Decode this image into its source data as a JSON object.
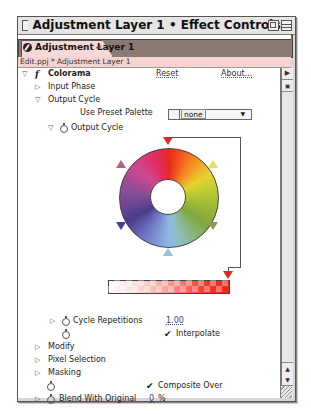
{
  "window": {
    "title": "Adjustment Layer 1 • Effect Controls"
  },
  "tab": {
    "label": "Adjustment Layer 1",
    "close_glyph": "↵"
  },
  "breadcrumb": "Edit.ppj * Adjustment Layer 1",
  "effect": {
    "name": "Colorama",
    "reset_label": "Reset",
    "about_label": "About..."
  },
  "rows": {
    "input_phase": "Input Phase",
    "output_cycle": "Output Cycle",
    "use_preset_palette": "Use Preset Palette",
    "preset_value": "none",
    "output_cycle_sub": "Output Cycle",
    "cycle_repetitions": "Cycle Repetitions",
    "cycle_repetitions_value": "1.00",
    "interpolate": "Interpolate",
    "modify": "Modify",
    "pixel_selection": "Pixel Selection",
    "masking": "Masking",
    "composite_over": "Composite Over",
    "blend_with_original": "Blend With Original",
    "blend_value": "0",
    "blend_unit": "%"
  },
  "glyphs": {
    "tri_right": "▷",
    "tri_down": "▽",
    "check": "✔",
    "fx": "f",
    "caret": "▼",
    "scroll_up": "▲",
    "scroll_down": "▼",
    "panel_menu": "▶"
  },
  "colors": {
    "tab_bg": "#f4d9d6",
    "breadcrumb_bg": "#f6d3d0",
    "tabstrip_bg": "#8b7a74",
    "link": "#3c3c9a"
  },
  "output_cycle_markers": [
    {
      "angle": 0,
      "color": "#e02a1c"
    },
    {
      "angle": 60,
      "color": "#e5e05a"
    },
    {
      "angle": 120,
      "color": "#8a9a50"
    },
    {
      "angle": 180,
      "color": "#9ac0d8"
    },
    {
      "angle": 240,
      "color": "#4a3c8f"
    },
    {
      "angle": 300,
      "color": "#b0608a"
    }
  ]
}
